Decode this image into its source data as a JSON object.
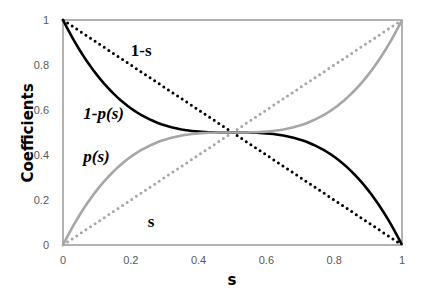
{
  "chart_data": {
    "type": "line",
    "title": "",
    "xlabel": "s",
    "ylabel": "Coefficients",
    "xlim": [
      0,
      1
    ],
    "ylim": [
      0,
      1
    ],
    "grid": false,
    "legend": "none",
    "xticks": [
      "0",
      "0.2",
      "0.4",
      "0.6",
      "0.8",
      "1"
    ],
    "yticks": [
      "0",
      "0.2",
      "0.4",
      "0.6",
      "0.8",
      "1"
    ],
    "series": [
      {
        "name": "1-s",
        "style": "dotted",
        "color": "#000000",
        "x": [
          0,
          1
        ],
        "y": [
          1,
          0
        ]
      },
      {
        "name": "s",
        "style": "dotted",
        "color": "#a6a6a6",
        "x": [
          0,
          1
        ],
        "y": [
          0,
          1
        ]
      },
      {
        "name": "1-p(s)",
        "style": "solid",
        "color": "#000000",
        "x": [
          0,
          0.1,
          0.2,
          0.3,
          0.4,
          0.5,
          0.6,
          0.7,
          0.8,
          0.9,
          1
        ],
        "y": [
          1,
          0.756,
          0.608,
          0.532,
          0.504,
          0.5,
          0.496,
          0.468,
          0.392,
          0.244,
          0
        ]
      },
      {
        "name": "p(s)",
        "style": "solid",
        "color": "#a6a6a6",
        "x": [
          0,
          0.1,
          0.2,
          0.3,
          0.4,
          0.5,
          0.6,
          0.7,
          0.8,
          0.9,
          1
        ],
        "y": [
          0,
          0.244,
          0.392,
          0.468,
          0.496,
          0.5,
          0.504,
          0.532,
          0.608,
          0.756,
          1
        ]
      }
    ],
    "annotations": [
      {
        "text": "1-s",
        "x": 0.2,
        "y": 0.84,
        "italic": false
      },
      {
        "text": "1-p(s)",
        "x": 0.06,
        "y": 0.56,
        "italic": true
      },
      {
        "text": "p(s)",
        "x": 0.06,
        "y": 0.37,
        "italic": true
      },
      {
        "text": "s",
        "x": 0.25,
        "y": 0.08,
        "italic": false
      }
    ]
  }
}
